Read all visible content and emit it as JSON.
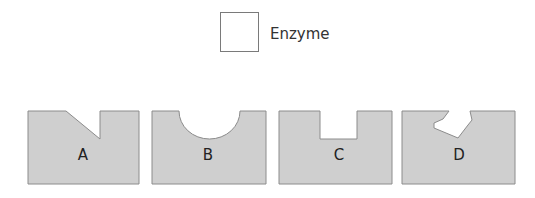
{
  "legend": {
    "label": "Enzyme",
    "icon": "empty-square"
  },
  "colors": {
    "shape_fill": "#cfcfcf",
    "shape_stroke": "#8c8c8c",
    "legend_stroke": "#7a7a7a",
    "text": "#222222"
  },
  "substrates": [
    {
      "label": "A",
      "notch": "diagonal-step"
    },
    {
      "label": "B",
      "notch": "semicircle"
    },
    {
      "label": "C",
      "notch": "rectangle"
    },
    {
      "label": "D",
      "notch": "irregular-polygon"
    }
  ]
}
